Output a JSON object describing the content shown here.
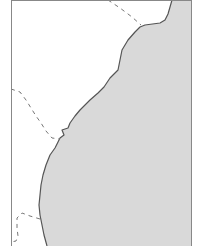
{
  "map": {
    "type": "coastline-outline-map",
    "colors": {
      "water": "#ffffff",
      "land": "#d9d9d9",
      "coastline": "#555555",
      "border": "#777777",
      "frame": "#888888"
    },
    "frame": {
      "left": 11,
      "right": 191,
      "top": 0
    },
    "land_path": "M172,0 L168,14 L165,20 L160,23 L145,25 L140,27 L135,32 L128,40 L122,50 L120,60 L118,70 L114,74 L110,78 L104,87 L98,93 L90,100 L80,110 L75,116 L70,123 L68,128 L62,130 L64,135 L60,138 L58,142 L55,148 L50,155 L46,165 L43,175 L41,185 L40,195 L39,205 L40,215 L42,225 L44,235 L47,246 L191,246 L191,0 Z",
    "coast_path": "M172,0 L168,14 L165,20 L160,23 L145,25 L140,27 L135,32 L128,40 L122,50 L120,60 L118,70 L114,74 L110,78 L104,87 L98,93 L90,100 L80,110 L75,116 L70,123 L68,128 L62,130 L64,135 L60,138 L58,142 L55,148 L50,155 L46,165 L43,175 L41,185 L40,195 L39,205 L40,215 L42,225 L44,235 L47,246",
    "borders": [
      {
        "name": "border-north",
        "path": "M108,0 L120,8 L132,17 L141,25"
      },
      {
        "name": "border-central",
        "path": "M11,89 L20,92 L26,100 L31,108 L36,116 L41,123 L46,131 L52,138 L60,139"
      },
      {
        "name": "border-south",
        "path": "M40,219 L30,216 L22,213 L17,218 L17,228 L18,236 L16,241 L11,242"
      }
    ]
  }
}
